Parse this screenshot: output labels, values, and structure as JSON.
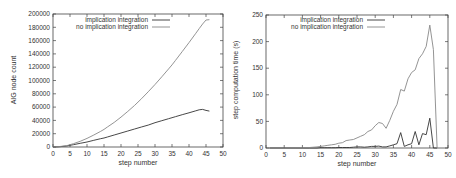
{
  "chart_data": [
    {
      "type": "line",
      "title": "",
      "xlabel": "step number",
      "ylabel": "AIG node count",
      "xlim": [
        0,
        50
      ],
      "ylim": [
        0,
        200000
      ],
      "xticks": [
        0,
        5,
        10,
        15,
        20,
        25,
        30,
        35,
        40,
        45,
        50
      ],
      "yticks": [
        0,
        20000,
        40000,
        60000,
        80000,
        100000,
        120000,
        140000,
        160000,
        180000,
        200000
      ],
      "grid": false,
      "legend_position": "top-center-inside",
      "x": [
        0,
        2,
        4,
        5,
        6,
        8,
        10,
        12,
        14,
        15,
        16,
        18,
        20,
        22,
        24,
        25,
        26,
        28,
        30,
        32,
        34,
        35,
        36,
        38,
        40,
        42,
        43,
        44,
        45,
        46
      ],
      "series": [
        {
          "name": "implication integration",
          "color": "#333333",
          "values": [
            0,
            500,
            1500,
            2500,
            3500,
            5500,
            7500,
            10000,
            12500,
            13500,
            15000,
            18000,
            21000,
            24000,
            27000,
            28500,
            30000,
            33000,
            36500,
            39500,
            42500,
            44000,
            45500,
            48500,
            51500,
            54500,
            56000,
            56500,
            55000,
            54000
          ]
        },
        {
          "name": "no implication integration",
          "color": "#888888",
          "values": [
            0,
            700,
            2000,
            3500,
            5000,
            8500,
            13000,
            18000,
            23500,
            26500,
            30000,
            37000,
            45000,
            53500,
            62500,
            67500,
            72500,
            83000,
            94000,
            105500,
            117500,
            123500,
            130000,
            143500,
            157000,
            171000,
            178000,
            185000,
            191000,
            191500
          ]
        }
      ]
    },
    {
      "type": "line",
      "title": "",
      "xlabel": "step number",
      "ylabel": "step computation time (s)",
      "xlim": [
        0,
        50
      ],
      "ylim": [
        0,
        250
      ],
      "xticks": [
        0,
        5,
        10,
        15,
        20,
        25,
        30,
        35,
        40,
        45,
        50
      ],
      "yticks": [
        0,
        50,
        100,
        150,
        200,
        250
      ],
      "grid": false,
      "legend_position": "top-center-inside",
      "x": [
        1,
        5,
        10,
        12,
        14,
        15,
        16,
        17,
        18,
        19,
        20,
        21,
        22,
        23,
        24,
        25,
        26,
        27,
        28,
        29,
        30,
        31,
        32,
        33,
        34,
        35,
        36,
        37,
        38,
        39,
        40,
        41,
        42,
        43,
        44,
        45,
        46,
        47
      ],
      "series": [
        {
          "name": "implication integration",
          "color": "#333333",
          "values": [
            0,
            0,
            0,
            0,
            0,
            0.5,
            0.5,
            0.5,
            0.5,
            0.5,
            1,
            1,
            1,
            1,
            1.5,
            2,
            2,
            1.5,
            2,
            3,
            3,
            3.5,
            2,
            2,
            4,
            6,
            8,
            29,
            3,
            6,
            8,
            31,
            6,
            27,
            25,
            56,
            0,
            0
          ]
        },
        {
          "name": "no implication integration",
          "color": "#888888",
          "values": [
            0,
            0,
            0.5,
            1,
            2,
            3,
            4,
            5,
            6,
            7,
            9,
            10,
            14,
            15,
            16,
            19,
            22,
            25,
            31,
            34,
            42,
            48,
            46,
            37,
            52,
            69,
            82,
            110,
            107,
            130,
            142,
            147,
            168,
            177,
            191,
            231,
            185,
            0
          ]
        }
      ]
    }
  ]
}
